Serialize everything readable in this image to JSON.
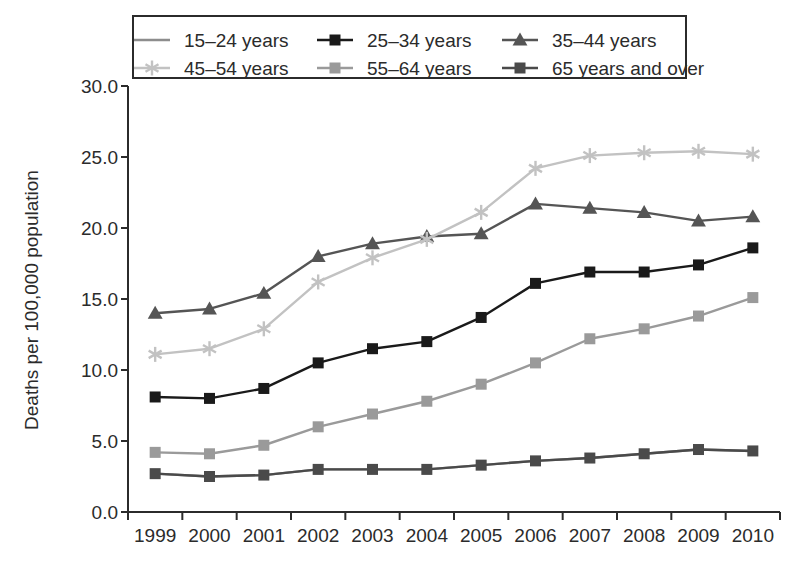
{
  "chart_data": {
    "type": "line",
    "title": "",
    "xlabel": "",
    "ylabel": "Deaths per 100,000 population",
    "x": [
      "1999",
      "2000",
      "2001",
      "2002",
      "2003",
      "2004",
      "2005",
      "2006",
      "2007",
      "2008",
      "2009",
      "2010"
    ],
    "xlim": [
      1999,
      2010
    ],
    "ylim": [
      0.0,
      30.0
    ],
    "yticks": [
      "0.0",
      "5.0",
      "10.0",
      "15.0",
      "20.0",
      "25.0",
      "30.0"
    ],
    "ytick_values": [
      0.0,
      5.0,
      10.0,
      15.0,
      20.0,
      25.0,
      30.0
    ],
    "grid": false,
    "legend_position": "top",
    "series": [
      {
        "name": "15–24 years",
        "marker": "none",
        "color": "#8d8d8d",
        "values": [
          2.7,
          2.5,
          2.6,
          3.0,
          3.0,
          3.0,
          3.3,
          3.6,
          3.8,
          4.1,
          4.4,
          4.3
        ]
      },
      {
        "name": "25–34 years",
        "marker": "square",
        "color": "#1a1a1a",
        "values": [
          8.1,
          8.0,
          8.7,
          10.5,
          11.5,
          12.0,
          13.7,
          16.1,
          16.9,
          16.9,
          17.4,
          18.6
        ]
      },
      {
        "name": "35–44 years",
        "marker": "triangle",
        "color": "#555555",
        "values": [
          14.0,
          14.3,
          15.4,
          18.0,
          18.9,
          19.4,
          19.6,
          21.7,
          21.4,
          21.1,
          20.5,
          20.8
        ]
      },
      {
        "name": "45–54 years",
        "marker": "asterisk",
        "color": "#c2c2c2",
        "values": [
          11.1,
          11.5,
          12.9,
          16.2,
          17.9,
          19.2,
          21.1,
          24.2,
          25.1,
          25.3,
          25.4,
          25.2
        ]
      },
      {
        "name": "55–64 years",
        "marker": "square",
        "color": "#9a9a9a",
        "values": [
          4.2,
          4.1,
          4.7,
          6.0,
          6.9,
          7.8,
          9.0,
          10.5,
          12.2,
          12.9,
          13.8,
          15.1
        ]
      },
      {
        "name": "65 years and over",
        "marker": "square",
        "color": "#4a4a4a",
        "values": [
          2.7,
          2.5,
          2.6,
          3.0,
          3.0,
          3.0,
          3.3,
          3.6,
          3.8,
          4.1,
          4.4,
          4.3
        ]
      }
    ],
    "legend_entries": [
      {
        "label": "15–24 years",
        "marker": "none",
        "color": "#8d8d8d"
      },
      {
        "label": "25–34 years",
        "marker": "square",
        "color": "#1a1a1a"
      },
      {
        "label": "35–44 years",
        "marker": "triangle",
        "color": "#555555"
      },
      {
        "label": "45–54 years",
        "marker": "asterisk",
        "color": "#c2c2c2"
      },
      {
        "label": "55–64 years",
        "marker": "square",
        "color": "#9a9a9a"
      },
      {
        "label": "65 years and over",
        "marker": "square",
        "color": "#4a4a4a"
      }
    ]
  }
}
